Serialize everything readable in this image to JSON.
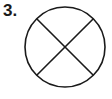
{
  "figure": {
    "number_label": "3.",
    "shape": "circle-with-x",
    "stroke_color": "#1a1a1a",
    "fill_color": "#ffffff"
  }
}
